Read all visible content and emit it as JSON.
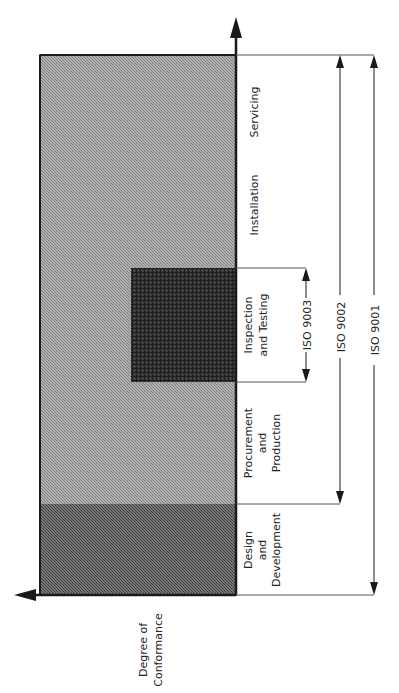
{
  "diagram": {
    "orientation": "rotated-90-ccw",
    "colors": {
      "background": "#ffffff",
      "main_fill": "#a8a8a8",
      "design_fill": "#6e6e6e",
      "inspection_fill": "#3c3c3c",
      "line": "#1a1a1a"
    },
    "axis": {
      "y_axis_label": "Degree of Conformance",
      "y_axis_label_lines": [
        "Degree of",
        "Conformance"
      ]
    },
    "stages": [
      {
        "id": "servicing",
        "lines": [
          "Servicing"
        ]
      },
      {
        "id": "installation",
        "lines": [
          "Installation"
        ]
      },
      {
        "id": "inspection",
        "lines": [
          "Inspection",
          "and Testing"
        ]
      },
      {
        "id": "procurement",
        "lines": [
          "Procurement",
          "and",
          "Production"
        ]
      },
      {
        "id": "design",
        "lines": [
          "Design",
          "and",
          "Development"
        ]
      }
    ],
    "standards": [
      {
        "id": "iso9003",
        "label": "ISO 9003",
        "covers": [
          "Inspection and Testing"
        ]
      },
      {
        "id": "iso9002",
        "label": "ISO 9002",
        "covers": [
          "Procurement and Production",
          "Inspection and Testing",
          "Installation",
          "Servicing"
        ]
      },
      {
        "id": "iso9001",
        "label": "ISO 9001",
        "covers": [
          "Design and Development",
          "Procurement and Production",
          "Inspection and Testing",
          "Installation",
          "Servicing"
        ]
      }
    ]
  }
}
